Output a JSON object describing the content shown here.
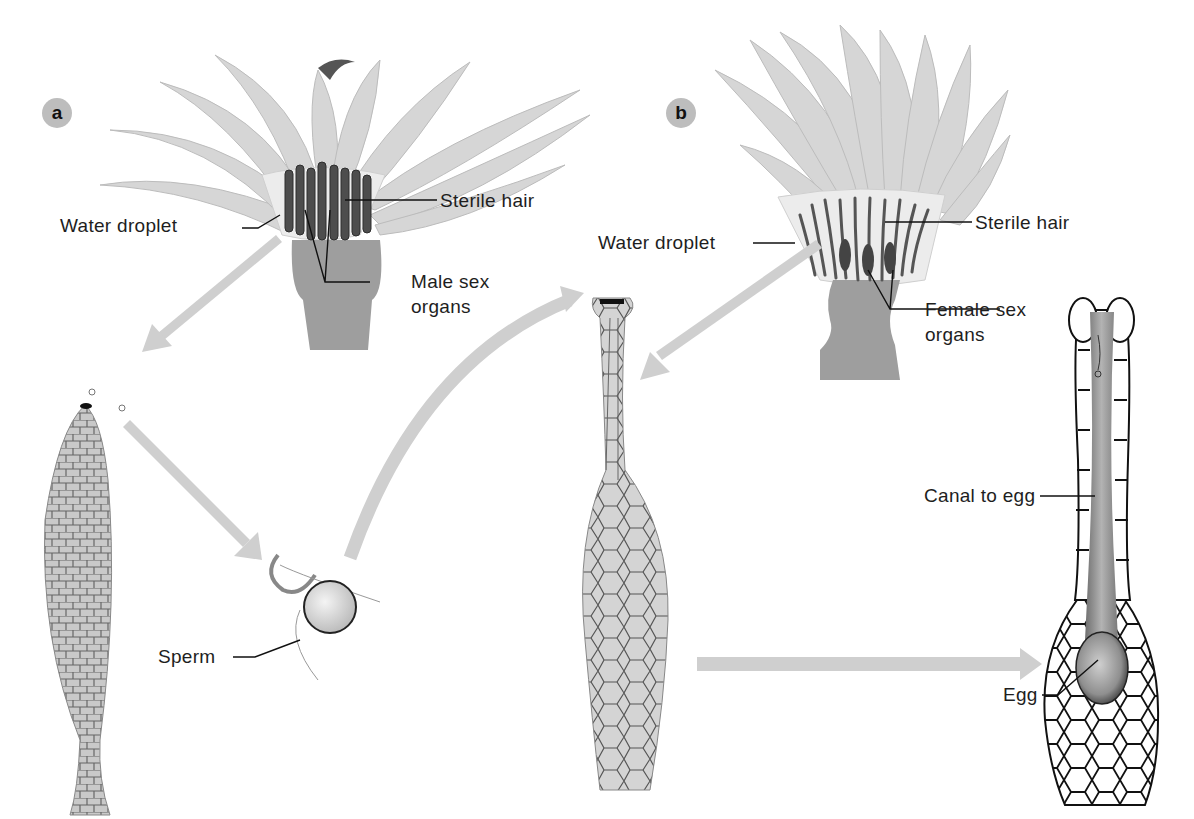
{
  "figure": {
    "panels": [
      {
        "id": "a",
        "badge": "a",
        "subject": "male-head"
      },
      {
        "id": "b",
        "badge": "b",
        "subject": "female-head"
      }
    ],
    "colors": {
      "arrow": "#cfcfcf",
      "leaf": "#d6d6d6",
      "leaf_edge": "#bcbcbc",
      "stalk": "#9e9e9e",
      "organ_dark": "#4a4a4a",
      "droplet": "#eeeeee",
      "cell_line": "#111111",
      "canal": "#8c8c8c",
      "text": "#1e1e1e"
    }
  },
  "labels": {
    "a": {
      "water_droplet": "Water droplet",
      "sterile_hair": "Sterile hair",
      "male_sex_organs_line1": "Male sex",
      "male_sex_organs_line2": "organs",
      "sperm": "Sperm"
    },
    "b": {
      "water_droplet": "Water droplet",
      "sterile_hair": "Sterile hair",
      "female_sex_organs_line1": "Female sex",
      "female_sex_organs_line2": "organs",
      "canal_to_egg": "Canal to egg",
      "egg": "Egg"
    }
  },
  "arrows": [
    {
      "from": "male-head",
      "to": "antheridium",
      "direction": "down-left"
    },
    {
      "from": "antheridium",
      "to": "sperm",
      "direction": "down-right"
    },
    {
      "from": "sperm",
      "to": "archegonium",
      "direction": "up-right-curved"
    },
    {
      "from": "female-head",
      "to": "archegonium",
      "direction": "down-left"
    },
    {
      "from": "archegonium",
      "to": "archegonium-section",
      "direction": "right"
    }
  ]
}
